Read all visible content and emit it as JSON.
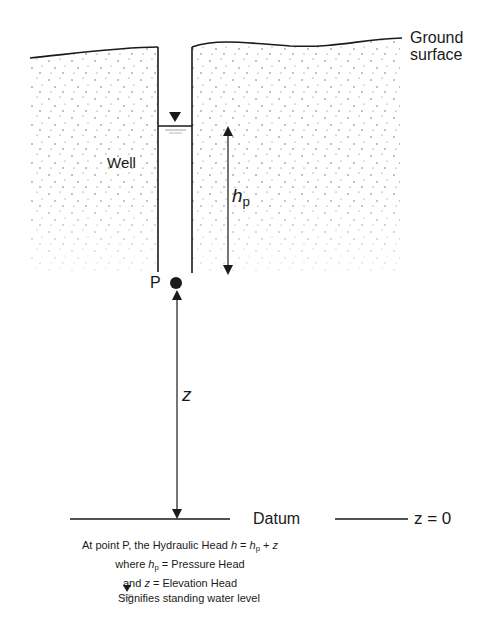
{
  "diagram": {
    "labels": {
      "ground_surface_line1": "Ground",
      "ground_surface_line2": "surface",
      "well": "Well",
      "pressure_head_symbol": "h",
      "pressure_head_subscript": "p",
      "point": "P",
      "elevation_symbol": "z",
      "datum": "Datum",
      "datum_equation": "z = 0"
    },
    "caption": {
      "line1_prefix": "At point P, the Hydraulic Head ",
      "line1_h": "h",
      "line1_eq": " = ",
      "line1_hp": "h",
      "line1_hp_sub": "p",
      "line1_plus": " + ",
      "line1_z": "z",
      "line2_prefix": "where ",
      "line2_hp": "h",
      "line2_hp_sub": "p",
      "line2_suffix": " =  Pressure Head",
      "line3_prefix": "and ",
      "line3_z": "z",
      "line3_suffix": " = Elevation Head",
      "line4": "Signifies standing water level"
    },
    "colors": {
      "ink": "#1a1a1a",
      "background": "#ffffff",
      "stipple": "#555555"
    }
  }
}
